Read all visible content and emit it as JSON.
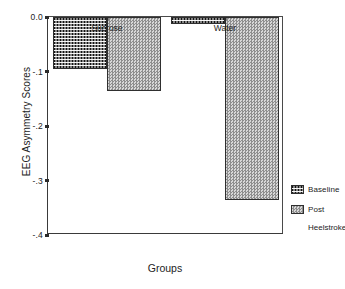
{
  "chart_data": {
    "type": "bar",
    "title": "",
    "xlabel": "Groups",
    "ylabel": "EEG Asymmetry Scores",
    "categories": [
      "Sucrose",
      "Water"
    ],
    "series": [
      {
        "name": "Baseline",
        "values": [
          -0.095,
          -0.012
        ],
        "pattern": "dark-dotted-checker",
        "color": "#141414"
      },
      {
        "name": "Post",
        "values": [
          -0.135,
          -0.335
        ],
        "pattern": "light-checker",
        "color": "#b4b4b4"
      }
    ],
    "legend_caption": "Heelstroke",
    "legend_position": "right",
    "grid": false,
    "ylim": [
      -0.4,
      0.0
    ],
    "y_ticks": [
      {
        "value": 0.0,
        "label": "0.0"
      },
      {
        "value": -0.1,
        "label": "-.1"
      },
      {
        "value": -0.2,
        "label": "-.2"
      },
      {
        "value": -0.3,
        "label": "-.3"
      },
      {
        "value": -0.4,
        "label": "-.4"
      }
    ]
  },
  "axes": {
    "y_title": "EEG Asymmetry Scores",
    "x_title": "Groups"
  },
  "legend": {
    "items": [
      {
        "label": "Baseline"
      },
      {
        "label": "Post"
      }
    ],
    "caption": "Heelstroke"
  }
}
